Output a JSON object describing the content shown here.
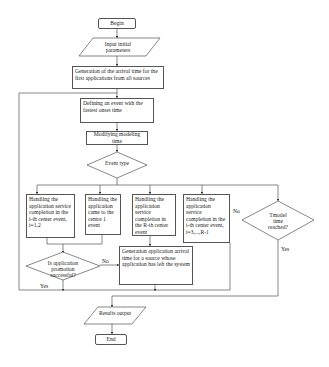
{
  "diagram": {
    "type": "flowchart",
    "nodes": {
      "begin": "Begin",
      "input": "Input initial parameters",
      "generate_first": "Generation of the arrival time for the first applications from all sources",
      "define_event": "Defining an event with the fastest onset time",
      "modify_time": "Modifying modeling time",
      "event_type": "Event type",
      "handle_ith": "Handling the application service completion in the i-th center event, i=1,2",
      "handle_center1": "Handling the application came to the centre 1 event",
      "handle_rth": "Handling the application service completion in the R-th center event",
      "handle_ith_3": "Handling the application service completion in the i-th center event, i=3,...,R-1",
      "promotion_q": "Is application promotion successful?",
      "generate_new": "Generation application arrival time for a source whose application has left the system",
      "tmodel_q": "Tmodel time reached?",
      "results": "Results output",
      "end": "End"
    },
    "edge_labels": {
      "promotion_no": "No",
      "promotion_yes": "Yes",
      "tmodel_no": "No",
      "tmodel_yes": "Yes"
    }
  }
}
